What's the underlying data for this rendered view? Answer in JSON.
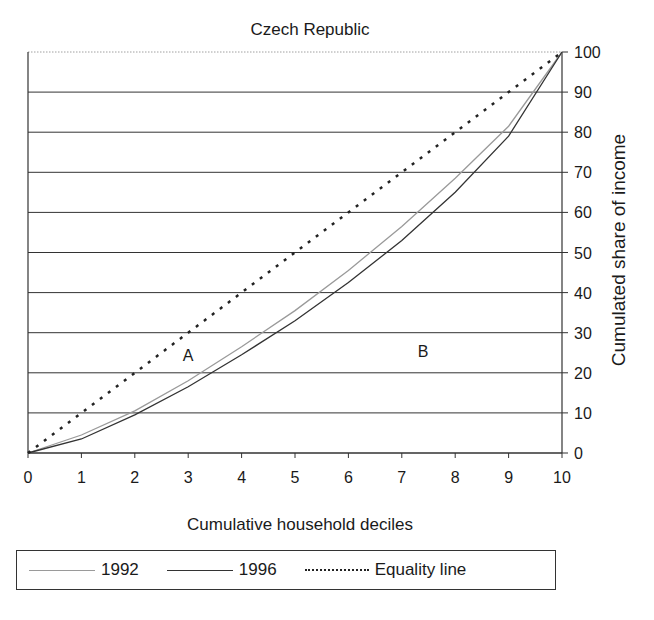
{
  "chart_data": {
    "type": "line",
    "title": "Czech Republic",
    "xlabel": "Cumulative household deciles",
    "ylabel": "Cumulated share of income",
    "x": [
      0,
      1,
      2,
      3,
      4,
      5,
      6,
      7,
      8,
      9,
      10
    ],
    "x_ticks": [
      "0",
      "1",
      "2",
      "3",
      "4",
      "5",
      "6",
      "7",
      "8",
      "9",
      "10"
    ],
    "y_ticks": [
      "0",
      "10",
      "20",
      "30",
      "40",
      "50",
      "60",
      "70",
      "80",
      "90",
      "100"
    ],
    "xlim": [
      0,
      10
    ],
    "ylim": [
      0,
      100
    ],
    "grid": "horizontal",
    "y_axis_position": "right",
    "legend_position": "bottom",
    "series": [
      {
        "name": "1992",
        "style": "solid-light-gray",
        "color": "#9a9a9a",
        "values": [
          0,
          4.5,
          10.5,
          18,
          26.5,
          35.5,
          45.5,
          56.5,
          68.5,
          81.5,
          100
        ]
      },
      {
        "name": "1996",
        "style": "solid-dark",
        "color": "#333333",
        "values": [
          0,
          3.5,
          9.5,
          16.5,
          24.5,
          33,
          42.5,
          53,
          65,
          79,
          100
        ]
      },
      {
        "name": "Equality line",
        "style": "dotted",
        "color": "#222222",
        "values": [
          0,
          10,
          20,
          30,
          40,
          50,
          60,
          70,
          80,
          90,
          100
        ]
      }
    ],
    "annotations": [
      {
        "text": "A",
        "x": 3,
        "y": 23
      },
      {
        "text": "B",
        "x": 7.4,
        "y": 24
      }
    ]
  },
  "legend": {
    "items": [
      {
        "label": "1992"
      },
      {
        "label": "1996"
      },
      {
        "label": "Equality line"
      }
    ]
  }
}
